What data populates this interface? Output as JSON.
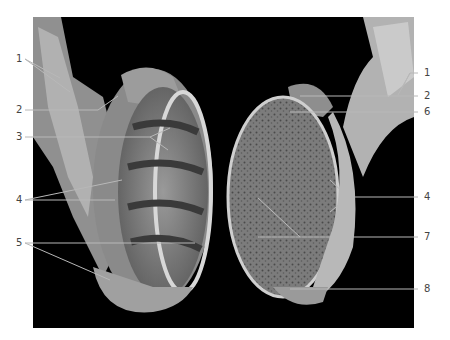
{
  "figure": {
    "background_color": "#000000",
    "label_color": "#444444",
    "leader_color": "#b8b8b8"
  },
  "labels_left": [
    {
      "number": "1",
      "y": 59
    },
    {
      "number": "2",
      "y": 110
    },
    {
      "number": "3",
      "y": 137
    },
    {
      "number": "4",
      "y": 200
    },
    {
      "number": "5",
      "y": 243
    }
  ],
  "labels_right": [
    {
      "number": "1",
      "y": 73
    },
    {
      "number": "2",
      "y": 96
    },
    {
      "number": "6",
      "y": 112
    },
    {
      "number": "4",
      "y": 197
    },
    {
      "number": "7",
      "y": 237
    },
    {
      "number": "8",
      "y": 289
    }
  ]
}
